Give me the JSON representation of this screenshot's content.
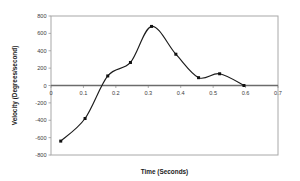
{
  "chart_data": {
    "type": "line",
    "title": "",
    "xlabel": "Time (Seconds)",
    "ylabel": "Velocity (Degrees/second)",
    "xlim": [
      0,
      0.7
    ],
    "ylim": [
      -800,
      800
    ],
    "xticks": [
      0,
      0.1,
      0.2,
      0.3,
      0.4,
      0.5,
      0.6,
      0.7
    ],
    "xticklabels": [
      "0",
      "0.1",
      "0.2",
      "0.3",
      "0.4",
      "0.5",
      "0.6",
      "0.7"
    ],
    "yticks": [
      -800,
      -600,
      -400,
      -200,
      0,
      200,
      400,
      600,
      800
    ],
    "yticklabels": [
      "-800",
      "-600",
      "-400",
      "-200",
      "0",
      "200",
      "400",
      "600",
      "800"
    ],
    "grid": false,
    "legend": null,
    "series": [
      {
        "name": "Velocity",
        "marker": "square",
        "color": "#111111",
        "x": [
          0.03,
          0.105,
          0.175,
          0.245,
          0.31,
          0.385,
          0.455,
          0.52,
          0.595
        ],
        "y": [
          -640,
          -380,
          110,
          265,
          680,
          360,
          90,
          135,
          0
        ]
      }
    ],
    "zero_reference_line": 0,
    "annotations": []
  },
  "axis_titles": {
    "x": "Time (Seconds)",
    "y": "Velocity (Degrees/second)"
  },
  "colors": {
    "line": "#1c1c1c",
    "marker": "#111111",
    "border": "#a8a8a8",
    "zero_line": "#6b6b6b",
    "tick_text": "#3d3d3d",
    "background": "#ffffff"
  }
}
